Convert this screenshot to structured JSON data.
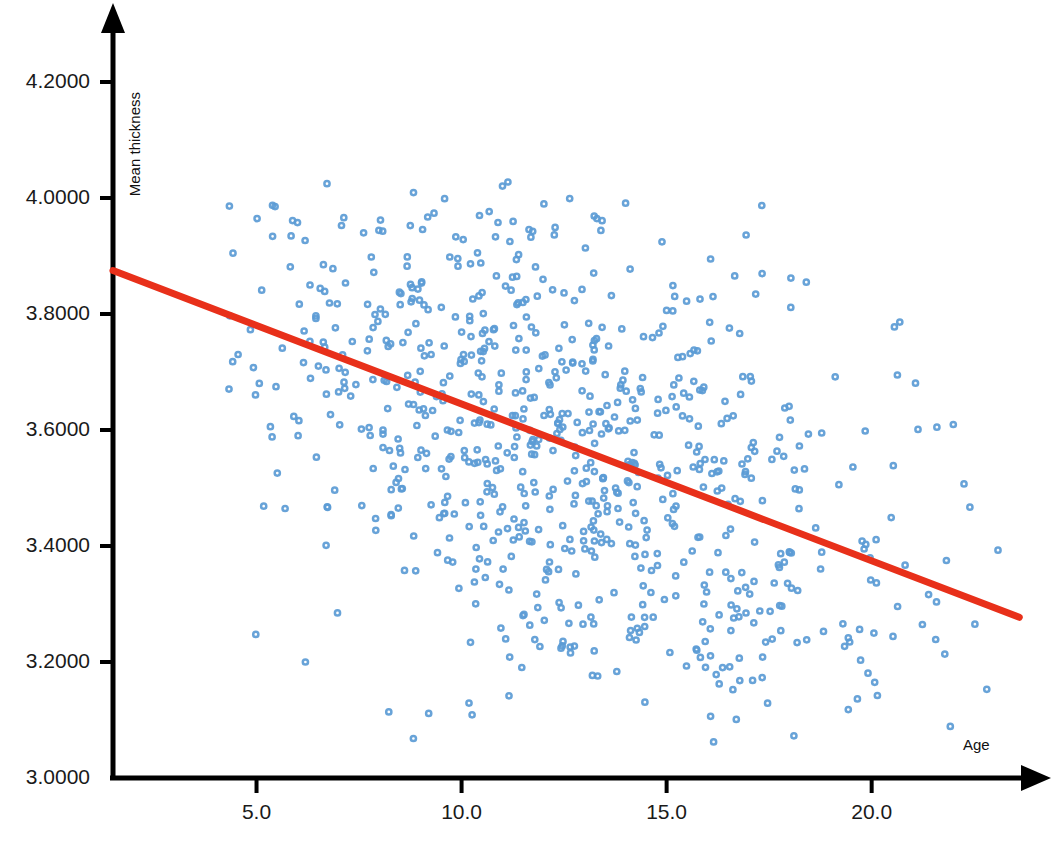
{
  "chart_data": {
    "type": "scatter",
    "title": "",
    "xlabel": "Age",
    "ylabel": "Mean thickness",
    "xlim": [
      1.5,
      24.3
    ],
    "ylim": [
      3.0,
      4.22
    ],
    "grid": false,
    "legend": "none",
    "x_ticks": [
      "5.0",
      "10.0",
      "15.0",
      "20.0"
    ],
    "x_tick_values": [
      5.0,
      10.0,
      15.0,
      20.0
    ],
    "y_ticks": [
      "3.0000",
      "3.2000",
      "3.4000",
      "3.6000",
      "3.8000",
      "4.0000",
      "4.2000"
    ],
    "y_tick_values": [
      3.0,
      3.2,
      3.4,
      3.6,
      3.8,
      4.0,
      4.2
    ],
    "marker_color": "#5B9BD5",
    "marker_style": "open-circle",
    "n_points": 800,
    "series": [
      {
        "name": "Mean thickness vs Age",
        "marker": "open-circle",
        "color": "#5B9BD5",
        "x_range": [
          4.3,
          23.2
        ],
        "y_range": [
          3.06,
          4.03
        ],
        "x_mean": 12.2,
        "y_mean": 3.56,
        "x_sd": 4.4,
        "y_sd": 0.19,
        "correlation": -0.48
      }
    ],
    "fit_line": {
      "name": "Linear regression fit",
      "color": "#E8301A",
      "width_px": 7,
      "x_start": 1.5,
      "y_start": 3.875,
      "x_end": 23.6,
      "y_end": 3.277,
      "slope": -0.027,
      "intercept": 3.916
    },
    "axis": {
      "color": "#000000",
      "arrow_x": true,
      "arrow_y": true,
      "line_width_px": 5
    }
  }
}
